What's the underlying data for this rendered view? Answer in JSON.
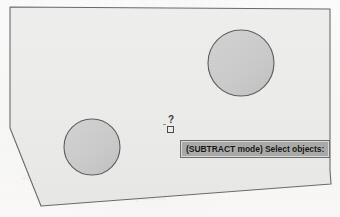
{
  "figure": {
    "caption_absent": true,
    "background_color": "#fcfbfa",
    "region_fill": "#ececeb",
    "region_stroke": "#6b6b6b",
    "circle_fill": "#cccccc",
    "circle_stroke": "#5e5e5e"
  },
  "region": {
    "name": "chamfered-region-outline",
    "points": "10,7 330,9 330,170 331,184 41,206 10,128"
  },
  "circles": [
    {
      "name": "circle-right",
      "cx": 241,
      "cy": 63,
      "r": 33
    },
    {
      "name": "circle-left",
      "cx": 92,
      "cy": 147,
      "r": 28
    }
  ],
  "cursor": {
    "pickbox_label": "pickbox",
    "glyph": "?",
    "x": 167,
    "y": 126
  },
  "prompt": {
    "text": "(SUBTRACT mode) Select objects:",
    "background_color": "#a9a9a7",
    "text_color": "#141414"
  },
  "ghost_text": [
    {
      "text": "Figure 8-23",
      "x": 128,
      "y": 24,
      "size": 9
    },
    {
      "text": "region on which the solid objects and the",
      "x": 30,
      "y": 50,
      "size": 9.5
    },
    {
      "text": "the area to be subtracted. In Subtract",
      "x": 18,
      "y": 82,
      "size": 10
    },
    {
      "text": "SUBTRACT mode) Select objects:",
      "x": 38,
      "y": 126,
      "size": 9
    },
    {
      "text": "command prompt. Select objects and press",
      "x": 22,
      "y": 172,
      "size": 9.5
    },
    {
      "text": "to complete the subtraction.",
      "x": 52,
      "y": 192,
      "size": 9.5
    }
  ]
}
